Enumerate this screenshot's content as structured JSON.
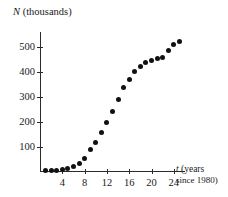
{
  "chart_data": {
    "type": "scatter",
    "title": "",
    "ylabel": "N (thousands)",
    "ylabel_variable": "N",
    "ylabel_rest": " (thousands)",
    "xlabel": "t (years since 1980)",
    "xlabel_variable": "t",
    "xlabel_line1": " (years",
    "xlabel_line2": "since 1980)",
    "xlim": [
      0,
      26
    ],
    "ylim": [
      0,
      560
    ],
    "grid": false,
    "legend": null,
    "xticks": [
      4,
      8,
      12,
      16,
      20,
      24
    ],
    "yticks": [
      100,
      200,
      300,
      400,
      500
    ],
    "x": [
      1,
      2,
      3,
      4,
      5,
      6,
      7,
      8,
      9,
      10,
      11,
      12,
      13,
      14,
      15,
      16,
      17,
      18,
      19,
      20,
      21,
      22,
      23,
      24,
      25
    ],
    "values": [
      5,
      6,
      8,
      10,
      14,
      22,
      35,
      55,
      90,
      120,
      157,
      197,
      242,
      290,
      338,
      372,
      402,
      423,
      437,
      448,
      456,
      458,
      487,
      512,
      522
    ],
    "marker": "filled-circle",
    "marker_color": "#111111",
    "axis_color": "#2b2b2b",
    "background": "#ffffff"
  },
  "axes": {
    "y_tick_labels": [
      "500",
      "400",
      "300",
      "200",
      "100"
    ],
    "x_tick_labels": [
      "4",
      "8",
      "12",
      "16",
      "20",
      "24"
    ]
  }
}
